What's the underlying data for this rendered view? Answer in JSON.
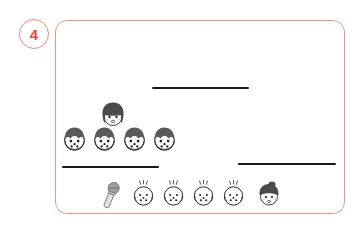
{
  "worksheet": {
    "item_number": "4",
    "card": {
      "border_color": "#f0938c",
      "background": "#ffffff",
      "x": 55,
      "y": 20,
      "width": 290,
      "height": 194
    },
    "badge": {
      "label": "4",
      "text_color": "#e8483c",
      "border_color": "#ef8a82"
    },
    "answer_lines": [
      {
        "name": "answer-line-top",
        "x": 152,
        "y": 87,
        "width": 97,
        "color": "#191919"
      },
      {
        "name": "answer-line-middle",
        "x": 62,
        "y": 166,
        "width": 97,
        "color": "#191919"
      },
      {
        "name": "answer-line-bottom",
        "x": 238,
        "y": 163,
        "width": 98,
        "color": "#191919"
      }
    ],
    "icons": {
      "bob-hair-face": {
        "label": "bob-hair-face-icon",
        "x": 98,
        "y": 100,
        "size": 30,
        "hair_color": "#4b4b4b",
        "skin_color": "#ffffff"
      },
      "fringe-face": {
        "label": "fringe-face-icon",
        "size": 31,
        "hair_color": "#5a5a5a",
        "skin_color": "#ffffff"
      },
      "baby-face": {
        "label": "baby-face-icon",
        "size": 29,
        "hair_color": "#3a3a3a",
        "skin_color": "#ffffff"
      },
      "bun-hair-face": {
        "label": "bun-hair-face-icon",
        "x": 255,
        "y": 180,
        "size": 28,
        "hair_color": "#4b4b4b",
        "skin_color": "#ffffff"
      },
      "microphone": {
        "label": "microphone-icon",
        "x": 97,
        "y": 180,
        "width": 27,
        "height": 32,
        "body_color": "#a8a8a8",
        "head_color": "#8c8c8c"
      }
    },
    "rows": [
      {
        "name": "row-fringe-faces",
        "count": 4,
        "y": 124,
        "start_x": 59,
        "spacing": 30,
        "icon": "fringe-face"
      },
      {
        "name": "row-baby-faces",
        "count": 4,
        "y": 180,
        "start_x": 129,
        "spacing": 30,
        "icon": "baby-face"
      }
    ]
  }
}
